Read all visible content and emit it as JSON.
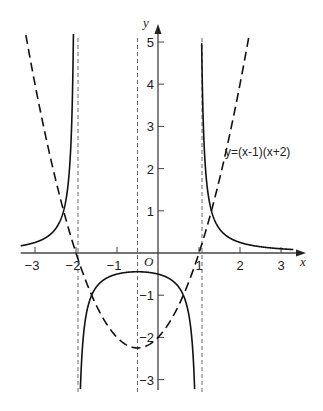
{
  "chart_data": {
    "type": "line",
    "title": "",
    "xlabel": "x",
    "ylabel": "y",
    "origin_label": "O",
    "xlim": [
      -3.3,
      3.4
    ],
    "ylim": [
      -3.3,
      5.2
    ],
    "grid": false,
    "x_ticks": [
      -3,
      -2,
      -1,
      1,
      2,
      3
    ],
    "x_tick_labels": [
      "-3",
      "-2",
      "-1",
      "1",
      "2",
      "3"
    ],
    "y_ticks": [
      5,
      4,
      3,
      2,
      1,
      -1,
      -2,
      -3
    ],
    "y_tick_labels": [
      "5",
      "4",
      "3",
      "2",
      "1",
      "-1",
      "-2",
      "-3"
    ],
    "vertical_asymptotes": [
      -2,
      -0.5,
      1
    ],
    "series": [
      {
        "name": "y=(x-1)(x+2)",
        "style": "dashed",
        "expression": "(x-1)(x+2)",
        "annotation": "y=(x-1)(x+2)",
        "key_points": [
          {
            "x": -2,
            "y": 0
          },
          {
            "x": 1,
            "y": 0
          },
          {
            "x": -0.5,
            "y": -2.25
          },
          {
            "x": 0,
            "y": -2
          }
        ]
      },
      {
        "name": "y=1/((x-1)(x+2))",
        "style": "solid",
        "expression": "1/((x-1)(x+2))",
        "key_points": [
          {
            "x": -0.5,
            "y": -0.444
          },
          {
            "x": 0,
            "y": -0.5
          },
          {
            "x": 3,
            "y": 0.1
          },
          {
            "x": -3,
            "y": 0.25
          }
        ]
      }
    ]
  }
}
